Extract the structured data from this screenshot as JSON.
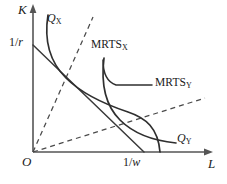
{
  "figure": {
    "background_color": "#ffffff",
    "line_color": "#3a3a3a",
    "text_color": "#1a1a1a"
  },
  "axes": {
    "y_label": "K",
    "x_label": "L",
    "origin_label": "O",
    "y_intercept_label_num": "1/",
    "y_intercept_label_den": "r",
    "x_intercept_label_num": "1/",
    "x_intercept_label_den": "w"
  },
  "curves": {
    "isoquant_x_label": "Q",
    "isoquant_x_sub": "X",
    "isoquant_y_label": "Q",
    "isoquant_y_sub": "Y",
    "mrts_x_label": "MRTS",
    "mrts_x_sub": "X",
    "mrts_y_label": "MRTS",
    "mrts_y_sub": "Y"
  },
  "chart_data": {
    "type": "line",
    "xlabel": "L",
    "ylabel": "K",
    "xlim": [
      0,
      212
    ],
    "ylim": [
      0,
      152
    ],
    "grid": false,
    "legend_position": "inline-annotations",
    "series": [
      {
        "name": "Q_X",
        "kind": "isoquant",
        "label": "Q_X",
        "style": "solid",
        "points": "M48,15 C44,40 50,62 66,78 C82,94 104,104 128,112 C146,118 158,128 160,152"
      },
      {
        "name": "Q_Y",
        "kind": "isoquant",
        "label": "Q_Y",
        "style": "solid",
        "points": "M104,58 C101,82 104,104 120,120 C134,134 156,141 176,143"
      },
      {
        "name": "isocost",
        "kind": "budget-line",
        "label": "",
        "style": "solid",
        "points": "M33,45 L144,152"
      },
      {
        "name": "expansion-path-X",
        "kind": "ray",
        "label": "MRTS_X",
        "style": "dashed",
        "points": "M33,152 L93,17"
      },
      {
        "name": "expansion-path-Y",
        "kind": "ray",
        "label": "MRTS_Y",
        "style": "dashed",
        "points": "M33,152 L205,98"
      },
      {
        "name": "mrts-y-leader",
        "kind": "leader",
        "label": "",
        "style": "solid",
        "points": "M103,60 C103,74 107,82 116,85 L152,85"
      }
    ],
    "annotations": [
      {
        "text": "K",
        "x": 20,
        "y": 8,
        "kind": "axis-label"
      },
      {
        "text": "L",
        "x": 209,
        "y": 162,
        "kind": "axis-label"
      },
      {
        "text": "O",
        "x": 24,
        "y": 160,
        "kind": "origin-label"
      },
      {
        "text": "1/r",
        "x": 10,
        "y": 38,
        "kind": "tick-label"
      },
      {
        "text": "1/w",
        "x": 125,
        "y": 159,
        "kind": "tick-label"
      },
      {
        "text": "Q_X",
        "x": 48,
        "y": 14,
        "kind": "curve-label"
      },
      {
        "text": "Q_Y",
        "x": 177,
        "y": 134,
        "kind": "curve-label"
      },
      {
        "text": "MRTS_X",
        "x": 92,
        "y": 41,
        "kind": "curve-label"
      },
      {
        "text": "MRTS_Y",
        "x": 131,
        "y": 79,
        "kind": "curve-label"
      }
    ]
  }
}
